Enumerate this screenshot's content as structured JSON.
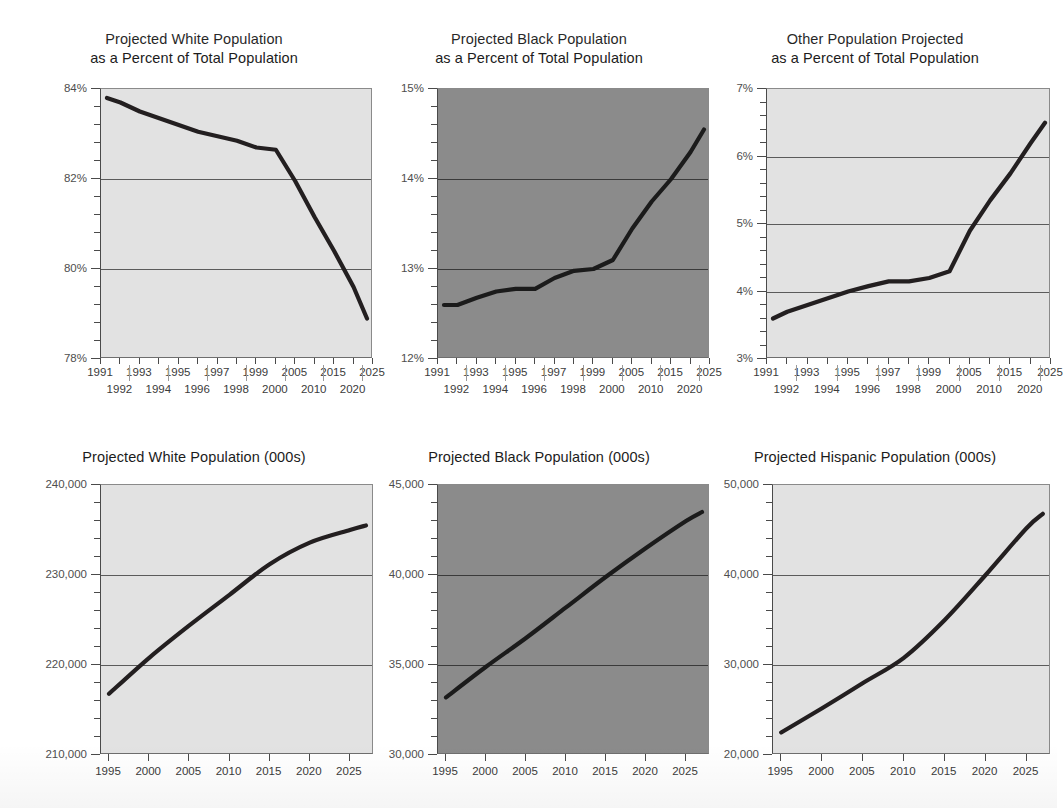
{
  "page": {
    "background_color": "#ffffff",
    "line_color": "#231f20",
    "light_plot_color": "#e2e2e2",
    "dark_plot_color": "#8b8b8b",
    "gridline_color": "#5b5b5b"
  },
  "charts": [
    {
      "id": "white-percent",
      "title": "Projected White Population\nas a Percent of Total Population",
      "panel_shade": "light",
      "ylabels": [
        "84%",
        "82%",
        "80%",
        "78%"
      ],
      "xlabels_upper": [
        "1991",
        "1993",
        "1995",
        "1997",
        "1999",
        "2005",
        "2015",
        "2025"
      ],
      "xlabels_lower": [
        "1992",
        "1994",
        "1996",
        "1998",
        "2000",
        "2010",
        "2020"
      ]
    },
    {
      "id": "black-percent",
      "title": "Projected Black Population\nas a Percent of Total Population",
      "panel_shade": "dark",
      "ylabels": [
        "15%",
        "14%",
        "13%",
        "12%"
      ],
      "xlabels_upper": [
        "1991",
        "1993",
        "1995",
        "1997",
        "1999",
        "2005",
        "2015",
        "2025"
      ],
      "xlabels_lower": [
        "1992",
        "1994",
        "1996",
        "1998",
        "2000",
        "2010",
        "2020"
      ]
    },
    {
      "id": "other-percent",
      "title": "Other Population Projected\nas a Percent of Total Population",
      "panel_shade": "light",
      "ylabels": [
        "7%",
        "6%",
        "5%",
        "4%",
        "3%"
      ],
      "xlabels_upper": [
        "1991",
        "1993",
        "1995",
        "1997",
        "1999",
        "2005",
        "2015",
        "2025"
      ],
      "xlabels_lower": [
        "1992",
        "1994",
        "1996",
        "1998",
        "2000",
        "2010",
        "2020"
      ]
    },
    {
      "id": "white-thousands",
      "title": "Projected White Population (000s)",
      "panel_shade": "light",
      "ylabels": [
        "240,000",
        "230,000",
        "220,000",
        "210,000"
      ],
      "xlabels_upper": [
        "1995",
        "2000",
        "2005",
        "2010",
        "2015",
        "2020",
        "2025"
      ],
      "xlabels_lower": []
    },
    {
      "id": "black-thousands",
      "title": "Projected Black Population (000s)",
      "panel_shade": "dark",
      "ylabels": [
        "45,000",
        "40,000",
        "35,000",
        "30,000"
      ],
      "xlabels_upper": [
        "1995",
        "2000",
        "2005",
        "2010",
        "2015",
        "2020",
        "2025"
      ],
      "xlabels_lower": []
    },
    {
      "id": "hispanic-thousands",
      "title": "Projected Hispanic Population (000s)",
      "panel_shade": "light",
      "ylabels": [
        "50,000",
        "40,000",
        "30,000",
        "20,000"
      ],
      "xlabels_upper": [
        "1995",
        "2000",
        "2005",
        "2010",
        "2015",
        "2020",
        "2025"
      ],
      "xlabels_lower": []
    }
  ],
  "chart_data": [
    {
      "type": "line",
      "title": "Projected White Population as a Percent of Total Population",
      "xlabel": "",
      "ylabel": "",
      "ylim": [
        78,
        84
      ],
      "yticks": [
        78,
        80,
        82,
        84
      ],
      "ytick_labels": [
        "78%",
        "80%",
        "82%",
        "84%"
      ],
      "grid": true,
      "grid_axis": "y",
      "legend": "none",
      "x": [
        1991,
        1992,
        1993,
        1994,
        1995,
        1996,
        1997,
        1998,
        1999,
        2000,
        2005,
        2010,
        2015,
        2020,
        2025
      ],
      "xtick_labels": [
        "1991",
        "1992",
        "1993",
        "1994",
        "1995",
        "1996",
        "1997",
        "1998",
        "1999",
        "2000",
        "2005",
        "2010",
        "2015",
        "2020",
        "2025"
      ],
      "values": [
        83.8,
        83.7,
        83.5,
        83.35,
        83.2,
        83.05,
        82.95,
        82.85,
        82.7,
        82.65,
        81.95,
        81.15,
        80.4,
        79.6,
        78.9
      ],
      "units": "percent of total population"
    },
    {
      "type": "line",
      "title": "Projected Black Population as a Percent of Total Population",
      "xlabel": "",
      "ylabel": "",
      "ylim": [
        12,
        15
      ],
      "yticks": [
        12,
        13,
        14,
        15
      ],
      "ytick_labels": [
        "12%",
        "13%",
        "14%",
        "15%"
      ],
      "grid": true,
      "grid_axis": "y",
      "legend": "none",
      "x": [
        1991,
        1992,
        1993,
        1994,
        1995,
        1996,
        1997,
        1998,
        1999,
        2000,
        2005,
        2010,
        2015,
        2020,
        2025
      ],
      "xtick_labels": [
        "1991",
        "1992",
        "1993",
        "1994",
        "1995",
        "1996",
        "1997",
        "1998",
        "1999",
        "2000",
        "2005",
        "2010",
        "2015",
        "2020",
        "2025"
      ],
      "values": [
        12.6,
        12.6,
        12.68,
        12.75,
        12.78,
        12.78,
        12.9,
        12.98,
        13.0,
        13.1,
        13.45,
        13.75,
        14.0,
        14.3,
        14.55
      ],
      "units": "percent of total population"
    },
    {
      "type": "line",
      "title": "Other Population Projected as a Percent of Total Population",
      "xlabel": "",
      "ylabel": "",
      "ylim": [
        3,
        7
      ],
      "yticks": [
        3,
        4,
        5,
        6,
        7
      ],
      "ytick_labels": [
        "3%",
        "4%",
        "5%",
        "6%",
        "7%"
      ],
      "grid": true,
      "grid_axis": "y",
      "legend": "none",
      "x": [
        1991,
        1992,
        1993,
        1994,
        1995,
        1996,
        1997,
        1998,
        1999,
        2000,
        2005,
        2010,
        2015,
        2020,
        2025
      ],
      "xtick_labels": [
        "1991",
        "1992",
        "1993",
        "1994",
        "1995",
        "1996",
        "1997",
        "1998",
        "1999",
        "2000",
        "2005",
        "2010",
        "2015",
        "2020",
        "2025"
      ],
      "values": [
        3.6,
        3.7,
        3.8,
        3.9,
        4.0,
        4.08,
        4.15,
        4.15,
        4.2,
        4.3,
        4.9,
        5.35,
        5.75,
        6.2,
        6.5
      ],
      "units": "percent of total population"
    },
    {
      "type": "line",
      "title": "Projected White Population (000s)",
      "xlabel": "",
      "ylabel": "",
      "ylim": [
        210000,
        240000
      ],
      "yticks": [
        210000,
        220000,
        230000,
        240000
      ],
      "ytick_labels": [
        "210,000",
        "220,000",
        "230,000",
        "240,000"
      ],
      "grid": true,
      "grid_axis": "y",
      "legend": "none",
      "x": [
        1995,
        2000,
        2005,
        2010,
        2015,
        2020,
        2025,
        2027
      ],
      "xtick_labels": [
        "1995",
        "2000",
        "2005",
        "2010",
        "2015",
        "2020",
        "2025"
      ],
      "values": [
        216800,
        220800,
        224400,
        227800,
        231200,
        233600,
        235000,
        235500
      ],
      "units": "thousands of persons"
    },
    {
      "type": "line",
      "title": "Projected Black Population (000s)",
      "xlabel": "",
      "ylabel": "",
      "ylim": [
        30000,
        45000
      ],
      "yticks": [
        30000,
        35000,
        40000,
        45000
      ],
      "ytick_labels": [
        "30,000",
        "35,000",
        "40,000",
        "45,000"
      ],
      "grid": true,
      "grid_axis": "y",
      "legend": "none",
      "x": [
        1995,
        2000,
        2005,
        2010,
        2015,
        2020,
        2025,
        2027
      ],
      "xtick_labels": [
        "1995",
        "2000",
        "2005",
        "2010",
        "2015",
        "2020",
        "2025"
      ],
      "values": [
        33200,
        34900,
        36500,
        38200,
        39900,
        41500,
        43000,
        43500
      ],
      "units": "thousands of persons"
    },
    {
      "type": "line",
      "title": "Projected Hispanic Population (000s)",
      "xlabel": "",
      "ylabel": "",
      "ylim": [
        20000,
        50000
      ],
      "yticks": [
        20000,
        30000,
        40000,
        50000
      ],
      "ytick_labels": [
        "20,000",
        "30,000",
        "40,000",
        "50,000"
      ],
      "grid": true,
      "grid_axis": "y",
      "legend": "none",
      "x": [
        1995,
        2000,
        2005,
        2010,
        2015,
        2020,
        2025,
        2027
      ],
      "xtick_labels": [
        "1995",
        "2000",
        "2005",
        "2010",
        "2015",
        "2020",
        "2025"
      ],
      "values": [
        22500,
        25200,
        28000,
        30800,
        35000,
        40000,
        45200,
        46800
      ],
      "units": "thousands of persons"
    }
  ]
}
